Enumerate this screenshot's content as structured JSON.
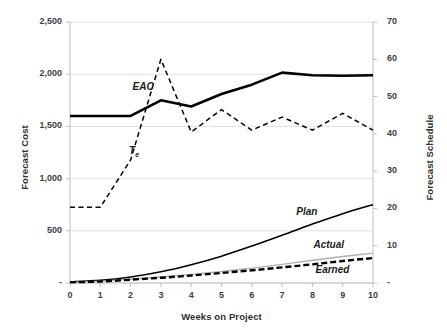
{
  "chart_data": {
    "type": "line",
    "title": "",
    "xlabel": "Weeks on Project",
    "ylabel": "Forecast Cost",
    "y2label": "Forecast Schedule",
    "grid": true,
    "legend_position": "inline-annotations",
    "x": [
      0,
      1,
      2,
      3,
      4,
      5,
      6,
      7,
      8,
      9,
      10
    ],
    "x_ticks": [
      "0",
      "1",
      "2",
      "3",
      "4",
      "5",
      "6",
      "7",
      "8",
      "9",
      "10"
    ],
    "xlim": [
      0,
      10
    ],
    "ylim": [
      0,
      2500
    ],
    "y_ticks": [
      "-",
      "500",
      "1,000",
      "1,500",
      "2,000",
      "2,500"
    ],
    "y_tick_values": [
      0,
      500,
      1000,
      1500,
      2000,
      2500
    ],
    "y2lim": [
      0,
      70
    ],
    "y2_ticks": [
      "-",
      "10",
      "20",
      "30",
      "40",
      "50",
      "60",
      "70"
    ],
    "y2_tick_values": [
      0,
      10,
      20,
      30,
      40,
      50,
      60,
      70
    ],
    "series": [
      {
        "name": "EAC",
        "axis": "left",
        "style": "solid-thick",
        "color": "#000000",
        "values": [
          1600,
          1600,
          1600,
          1750,
          1690,
          1810,
          1900,
          2015,
          1990,
          1985,
          1990
        ],
        "label_x": 2,
        "label_value": 1880
      },
      {
        "name": "Te",
        "axis": "right",
        "style": "dashed",
        "color": "#000000",
        "values": [
          20.3,
          20.3,
          33.0,
          60.0,
          40.5,
          46.5,
          41.0,
          44.5,
          41.0,
          45.5,
          41.0
        ],
        "label_x": 1.95,
        "label_value": 35.5
      },
      {
        "name": "Plan",
        "axis": "right",
        "style": "solid-thin",
        "color": "#000000",
        "values": [
          0.3,
          0.7,
          1.6,
          3.0,
          4.9,
          7.2,
          9.9,
          12.8,
          15.8,
          18.6,
          21.0
        ],
        "label_x": 7.6,
        "label_value": 19.0
      },
      {
        "name": "Actual",
        "axis": "right",
        "style": "solid-thin-gray",
        "color": "#b0b0b0",
        "values": [
          0.2,
          0.5,
          1.0,
          1.6,
          2.3,
          3.1,
          4.0,
          5.0,
          6.1,
          7.1,
          8.0
        ],
        "label_x": 8.3,
        "label_value": 10.3
      },
      {
        "name": "Earned",
        "axis": "right",
        "style": "dashed-thick",
        "color": "#000000",
        "values": [
          0.2,
          0.4,
          0.9,
          1.4,
          2.0,
          2.7,
          3.4,
          4.2,
          5.0,
          5.9,
          6.7
        ],
        "label_x": 8.3,
        "label_value": 3.5
      }
    ]
  },
  "labels": {
    "y_left_title": "Forecast Cost",
    "y_right_title": "Forecast Schedule",
    "x_title": "Weeks on Project",
    "eac": "EAC",
    "te_base": "T",
    "te_sub": "e",
    "plan": "Plan",
    "actual": "Actual",
    "earned": "Earned"
  }
}
